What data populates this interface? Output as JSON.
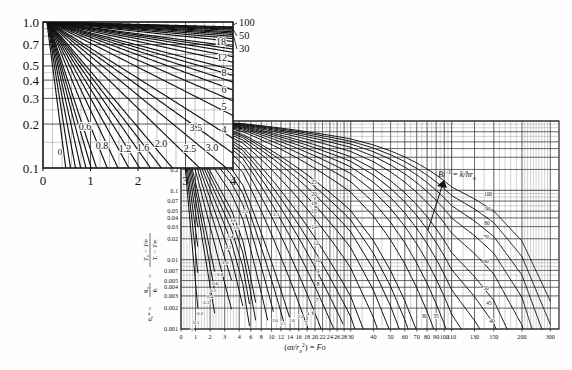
{
  "figure": {
    "name": "heisler-centerline-temperature-chart",
    "ylabel_plain": "θ₀* = θ₀/θᵢ = (T₀ − T∞)/(Tᵢ − T∞)",
    "xlabel_plain": "(αt/r₀²) = Fo",
    "annotation": "Bi⁻¹ = k/hr₀",
    "annotation_parts": {
      "bi": "Bi",
      "exp": "-1",
      "eq": "= k/hr",
      "sub": "o"
    }
  },
  "chart_data": {
    "type": "line",
    "title": "",
    "subtitle": "",
    "xlabel": "(αt/r₀²) = Fo",
    "ylabel": "θ₀* = θ₀/θᵢ = (T₀ − T∞)/(Tᵢ − T∞)",
    "xscale": "log-segmented",
    "yscale": "log",
    "xlim": [
      0,
      300
    ],
    "ylim": [
      0.001,
      1.0
    ],
    "grid": true,
    "legend": "inline-curve-labels",
    "annotations": [
      {
        "text": "Bi⁻¹ = k/hr₀",
        "x": 130,
        "y": 0.2
      }
    ],
    "main_axis": {
      "xticks": [
        0,
        1,
        2,
        3,
        4,
        6,
        8,
        10,
        12,
        14,
        16,
        18,
        20,
        22,
        24,
        26,
        28,
        30,
        40,
        50,
        60,
        70,
        80,
        90,
        100,
        110,
        130,
        150,
        200,
        300
      ],
      "xticklabels": [
        "0",
        "1",
        "2",
        "3",
        "4",
        "6",
        "8",
        "10",
        "12",
        "14",
        "16",
        "18",
        "20",
        "22",
        "24",
        "26",
        "28",
        "30",
        "40",
        "50",
        "60",
        "70",
        "80",
        "90",
        "100",
        "110",
        "130",
        "150",
        "200",
        "300"
      ],
      "yticks": [
        1.0,
        0.7,
        0.5,
        0.4,
        0.3,
        0.2,
        0.1,
        0.07,
        0.05,
        0.04,
        0.03,
        0.02,
        0.01,
        0.007,
        0.005,
        0.004,
        0.003,
        0.002,
        0.001
      ],
      "yticklabels": [
        "1.0",
        "0.7",
        "0.5",
        "0.4",
        "0.3",
        "0.2",
        "0.1",
        "0.07",
        "0.05",
        "0.04",
        "0.03",
        "0.02",
        "0.01",
        "0.007",
        "0.005",
        "0.004",
        "0.003",
        "0.002",
        "0.001"
      ],
      "upper_yticklabels": [
        "1.0",
        "0.7",
        "0.5",
        "0.4",
        "0.3",
        "0.2"
      ],
      "lower_yticklabels": [
        "0.1",
        "0.07",
        "0.05",
        "0.04",
        "0.03",
        "0.02",
        "0.01",
        "0.007",
        "0.005",
        "0.004",
        "0.003",
        "0.002",
        "0.001"
      ]
    },
    "inset": {
      "name": "magnified-region",
      "xlim": [
        0,
        4
      ],
      "ylim": [
        0.1,
        1.0
      ],
      "xticks": [
        0,
        1,
        2,
        3,
        4
      ],
      "xticklabels": [
        "0",
        "1",
        "2",
        "3",
        "4"
      ],
      "yticks": [
        1.0,
        0.7,
        0.5,
        0.4,
        0.3,
        0.2,
        0.1
      ],
      "yticklabels": [
        "1.0",
        "0.7",
        "0.5",
        "0.4",
        "0.3",
        "0.2",
        "0.1"
      ],
      "curve_labels_bottom": [
        "0",
        "0.6",
        "0.8",
        "1.2",
        "1.6",
        "2.0",
        "2.5",
        "3.0",
        "3.5"
      ],
      "curve_labels_right": [
        "100",
        "50",
        "30",
        "18",
        "12",
        "8",
        "6",
        "5",
        "4"
      ]
    },
    "series": [
      {
        "name": "0",
        "label": "0"
      },
      {
        "name": "0.1",
        "label": "0.1"
      },
      {
        "name": "0.2",
        "label": "0.2"
      },
      {
        "name": "0.3",
        "label": "0.3"
      },
      {
        "name": "0.4",
        "label": "0.4"
      },
      {
        "name": "0.5",
        "label": "0.5"
      },
      {
        "name": "0.6",
        "label": "0.6"
      },
      {
        "name": "0.8",
        "label": "0.8"
      },
      {
        "name": "1.0",
        "label": "1.0"
      },
      {
        "name": "1.2",
        "label": "1.2"
      },
      {
        "name": "1.4",
        "label": "1.4"
      },
      {
        "name": "1.6",
        "label": "1.6"
      },
      {
        "name": "1.8",
        "label": "1.8"
      },
      {
        "name": "2.0",
        "label": "2.0"
      },
      {
        "name": "2.5",
        "label": "2.5"
      },
      {
        "name": "3.0",
        "label": "3.0"
      },
      {
        "name": "3.5",
        "label": "3.5"
      },
      {
        "name": "4",
        "label": "4"
      },
      {
        "name": "5",
        "label": "5"
      },
      {
        "name": "6",
        "label": "6"
      },
      {
        "name": "7",
        "label": "7"
      },
      {
        "name": "8",
        "label": "8"
      },
      {
        "name": "9",
        "label": "9"
      },
      {
        "name": "10",
        "label": "10"
      },
      {
        "name": "12",
        "label": "12"
      },
      {
        "name": "14",
        "label": "14"
      },
      {
        "name": "16",
        "label": "16"
      },
      {
        "name": "18",
        "label": "18"
      },
      {
        "name": "20",
        "label": "20"
      },
      {
        "name": "25",
        "label": "25"
      },
      {
        "name": "30",
        "label": "30"
      },
      {
        "name": "35",
        "label": "35"
      },
      {
        "name": "40",
        "label": "40"
      },
      {
        "name": "45",
        "label": "45"
      },
      {
        "name": "50",
        "label": "50"
      },
      {
        "name": "60",
        "label": "60"
      },
      {
        "name": "70",
        "label": "70"
      },
      {
        "name": "80",
        "label": "80"
      },
      {
        "name": "90",
        "label": "90"
      },
      {
        "name": "100",
        "label": "100"
      }
    ]
  }
}
